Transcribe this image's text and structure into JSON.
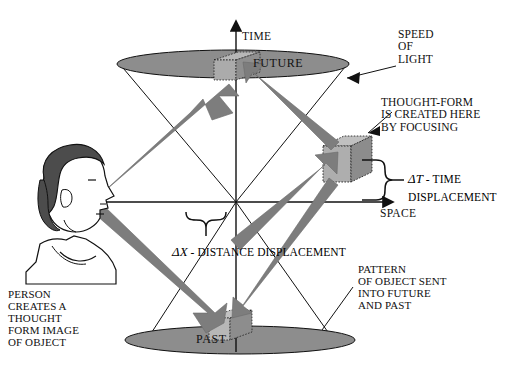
{
  "diagram": {
    "type": "minkowski-light-cone",
    "axes": {
      "time_label": "TIME",
      "space_label": "SPACE",
      "origin_name": "origin"
    },
    "cones": {
      "future_label": "FUTURE",
      "past_label": "PAST"
    },
    "annotations": {
      "speed_of_light": "SPEED\nOF\nLIGHT",
      "thought_form": "THOUGHT-FORM\nIS CREATED HERE\nBY FOCUSING",
      "time_displacement_symbol": "ΔT",
      "time_displacement_text": " -  TIME\nDISPLACEMENT",
      "distance_displacement_symbol": "ΔX",
      "distance_displacement_text": " - DISTANCE\nDISPLACEMENT",
      "person_caption": "PERSON\nCREATES A\nTHOUGHT\nFORM IMAGE\nOF OBJECT",
      "pattern_caption": "PATTERN\nOF OBJECT SENT\nINTO FUTURE\nAND PAST"
    },
    "objects": {
      "person_name": "person-head-profile",
      "future_cube_name": "future-object-cube",
      "past_cube_name": "past-object-cube",
      "thought_cube_name": "thought-form-cube"
    },
    "colors": {
      "ink": "#111111",
      "cone_fill": "#8a8a8a",
      "arrow_fill": "#7d7d7d",
      "cube_light": "#b4b4b4",
      "cube_mid": "#9a9a9a",
      "cube_dark": "#8a8a8a",
      "hair": "#4a4a4a",
      "skin": "#ffffff"
    }
  }
}
